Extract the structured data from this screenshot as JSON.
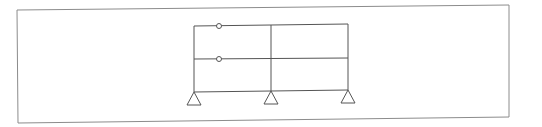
{
  "diagram": {
    "type": "structural-frame",
    "colors": {
      "background": "#ffffff",
      "border": "#8c8c8c",
      "frame": "#555555",
      "hinge_fill": "#ffffff"
    },
    "border": {
      "points": "17,10 509,5 509,117 18,123"
    },
    "columns": [
      {
        "id": "col-left",
        "x1": 194,
        "y1": 26,
        "x2": 194,
        "y2": 92
      },
      {
        "id": "col-middle",
        "x1": 271,
        "y1": 25,
        "x2": 271,
        "y2": 91
      },
      {
        "id": "col-right",
        "x1": 348,
        "y1": 24,
        "x2": 348,
        "y2": 90
      }
    ],
    "beams": [
      {
        "id": "beam-roof",
        "x1": 194,
        "y1": 26,
        "x2": 348,
        "y2": 24
      },
      {
        "id": "beam-middle",
        "x1": 194,
        "y1": 59,
        "x2": 348,
        "y2": 58
      },
      {
        "id": "beam-ground",
        "x1": 194,
        "y1": 92,
        "x2": 348,
        "y2": 90
      }
    ],
    "hinges": [
      {
        "id": "hinge-roof",
        "cx": 219,
        "cy": 26,
        "r": 2.5
      },
      {
        "id": "hinge-middle",
        "cx": 219,
        "cy": 59,
        "r": 2.5
      }
    ],
    "supports": [
      {
        "id": "support-left",
        "type": "pin",
        "apex": [
          194,
          92
        ],
        "base_y": 105,
        "half_width": 7
      },
      {
        "id": "support-middle",
        "type": "pin",
        "apex": [
          271,
          91
        ],
        "base_y": 104,
        "half_width": 7
      },
      {
        "id": "support-right",
        "type": "pin",
        "apex": [
          348,
          90
        ],
        "base_y": 103,
        "half_width": 7
      }
    ]
  }
}
